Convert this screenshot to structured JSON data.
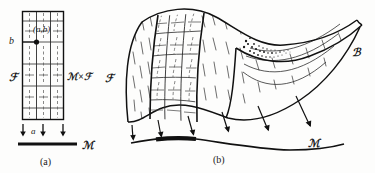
{
  "figure": {
    "caption_a": "(a)",
    "caption_b": "(b)",
    "panel_a": {
      "label_b": "b",
      "label_point": "(a,b)",
      "label_foliation": "ℱ",
      "label_product": "ℳ×ℱ",
      "label_a": "a",
      "label_base": "ℳ",
      "arrow_count": 3,
      "leaf_count": 3
    },
    "panel_b": {
      "label_foliation": "ℱ",
      "label_bundle": "ℬ",
      "label_base": "ℳ",
      "arrow_count": 6
    },
    "colors": {
      "ink": "#111111",
      "paper": "#fdfdfc",
      "hatch": "#3a3a3a"
    }
  }
}
